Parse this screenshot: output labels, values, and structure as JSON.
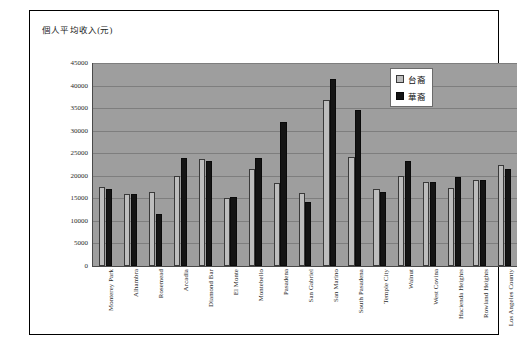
{
  "figure": {
    "title": "個人平均收入(元)"
  },
  "legend": {
    "position": "top-right-inside",
    "entries": [
      {
        "label": "台裔",
        "color": "#bdbdbd"
      },
      {
        "label": "華裔",
        "color": "#141414"
      }
    ]
  },
  "chart_data": {
    "type": "bar",
    "title": "個人平均收入(元)",
    "xlabel": "",
    "ylabel": "個人平均收入(元)",
    "ylim": [
      0,
      45000
    ],
    "ytick_step": 5000,
    "yticks": [
      0,
      5000,
      10000,
      15000,
      20000,
      25000,
      30000,
      35000,
      40000,
      45000
    ],
    "ytick_labels": [
      "0",
      "5000",
      "10000",
      "15000",
      "20000",
      "25000",
      "30000",
      "35000",
      "40000",
      "45000"
    ],
    "grid": true,
    "grid_axis": "y",
    "legend_position": "upper right",
    "plot_background": "#9e9e9e",
    "categories": [
      "Monterey Park",
      "Alhambra",
      "Rosemead",
      "Arcadia",
      "Diamond Bar",
      "El Monte",
      "Montebello",
      "Pasadena",
      "San Gabriel",
      "San Marino",
      "South Pasadena",
      "Temple City",
      "Walnut",
      "West Covina",
      "Hacienda Heights",
      "Rowland Heights",
      "Los Angeles County"
    ],
    "series": [
      {
        "name": "台裔",
        "color": "#bdbdbd",
        "values": [
          17500,
          16000,
          16500,
          20000,
          23700,
          15000,
          21500,
          18500,
          16200,
          36700,
          24200,
          17000,
          20000,
          18700,
          17200,
          19000,
          22500
        ]
      },
      {
        "name": "華裔",
        "color": "#141414",
        "values": [
          17000,
          16000,
          11500,
          24000,
          23300,
          15200,
          24000,
          32000,
          14200,
          41500,
          34500,
          16500,
          23200,
          18700,
          19700,
          19000,
          21500
        ]
      }
    ]
  }
}
